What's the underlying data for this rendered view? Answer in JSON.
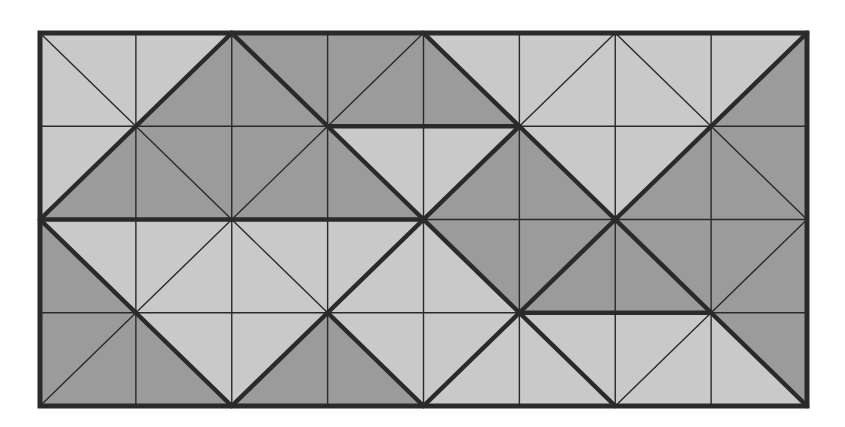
{
  "puzzle": {
    "rows": 4,
    "cols": 8,
    "origin": {
      "x": 40,
      "y": 33
    },
    "size": {
      "width": 767,
      "height": 373
    },
    "colors": {
      "light": "#c9c9c9",
      "dark": "#9b9b9b",
      "line": "#2a2a2a",
      "background": "#ffffff"
    },
    "line_widths": {
      "thin": 1.4,
      "thick": 4.5,
      "border": 5
    },
    "legend": "orientation: '\\\\' = top-left to bottom-right (halves: bottom-left, top-right); '/' = bottom-left to top-right (halves: top-left, bottom-right). shade: L=light, D=dark",
    "cells": [
      [
        {
          "dir": "\\",
          "halves": [
            "L",
            "L"
          ],
          "thick": false
        },
        {
          "dir": "/",
          "halves": [
            "L",
            "D"
          ],
          "thick": true
        },
        {
          "dir": "\\",
          "halves": [
            "D",
            "D"
          ],
          "thick": true
        },
        {
          "dir": "/",
          "halves": [
            "D",
            "D"
          ],
          "thick": false
        },
        {
          "dir": "\\",
          "halves": [
            "D",
            "L"
          ],
          "thick": true
        },
        {
          "dir": "/",
          "halves": [
            "L",
            "L"
          ],
          "thick": false
        },
        {
          "dir": "\\",
          "halves": [
            "L",
            "L"
          ],
          "thick": false
        },
        {
          "dir": "/",
          "halves": [
            "L",
            "D"
          ],
          "thick": true
        }
      ],
      [
        {
          "dir": "/",
          "halves": [
            "L",
            "D"
          ],
          "thick": true
        },
        {
          "dir": "\\",
          "halves": [
            "D",
            "D"
          ],
          "thick": false
        },
        {
          "dir": "/",
          "halves": [
            "D",
            "D"
          ],
          "thick": false
        },
        {
          "dir": "\\",
          "halves": [
            "D",
            "L"
          ],
          "thick": true
        },
        {
          "dir": "/",
          "halves": [
            "L",
            "D"
          ],
          "thick": true
        },
        {
          "dir": "\\",
          "halves": [
            "D",
            "L"
          ],
          "thick": true
        },
        {
          "dir": "/",
          "halves": [
            "L",
            "D"
          ],
          "thick": true
        },
        {
          "dir": "\\",
          "halves": [
            "D",
            "D"
          ],
          "thick": false
        }
      ],
      [
        {
          "dir": "\\",
          "halves": [
            "D",
            "L"
          ],
          "thick": true
        },
        {
          "dir": "/",
          "halves": [
            "L",
            "L"
          ],
          "thick": false
        },
        {
          "dir": "\\",
          "halves": [
            "L",
            "L"
          ],
          "thick": false
        },
        {
          "dir": "/",
          "halves": [
            "L",
            "L"
          ],
          "thick": true
        },
        {
          "dir": "\\",
          "halves": [
            "L",
            "D"
          ],
          "thick": true
        },
        {
          "dir": "/",
          "halves": [
            "D",
            "D"
          ],
          "thick": true
        },
        {
          "dir": "\\",
          "halves": [
            "D",
            "D"
          ],
          "thick": true
        },
        {
          "dir": "/",
          "halves": [
            "D",
            "D"
          ],
          "thick": false
        }
      ],
      [
        {
          "dir": "/",
          "halves": [
            "D",
            "D"
          ],
          "thick": false
        },
        {
          "dir": "\\",
          "halves": [
            "D",
            "L"
          ],
          "thick": true
        },
        {
          "dir": "/",
          "halves": [
            "L",
            "D"
          ],
          "thick": true
        },
        {
          "dir": "\\",
          "halves": [
            "D",
            "L"
          ],
          "thick": true
        },
        {
          "dir": "/",
          "halves": [
            "L",
            "L"
          ],
          "thick": true
        },
        {
          "dir": "\\",
          "halves": [
            "L",
            "L"
          ],
          "thick": true
        },
        {
          "dir": "/",
          "halves": [
            "L",
            "L"
          ],
          "thick": false
        },
        {
          "dir": "\\",
          "halves": [
            "L",
            "D"
          ],
          "thick": true
        }
      ]
    ],
    "thick_horizontal_segments": [
      {
        "row_line": 1,
        "col_from": 3,
        "col_to": 5
      },
      {
        "row_line": 2,
        "col_from": 0,
        "col_to": 4
      },
      {
        "row_line": 3,
        "col_from": 5,
        "col_to": 7
      }
    ]
  }
}
